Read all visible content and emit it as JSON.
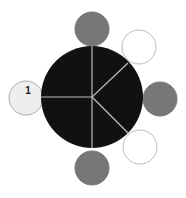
{
  "diagram": {
    "type": "hub-and-satellites",
    "top_cut_text": "",
    "hub": {
      "cx": 92,
      "cy": 97,
      "r": 51,
      "fill": "#111111",
      "divider_color": "#bbbbbb"
    },
    "dividers": [
      {
        "x2": 92,
        "y2": 46
      },
      {
        "x2": 41,
        "y2": 97
      },
      {
        "x2": 92,
        "y2": 148
      },
      {
        "x2": 128,
        "y2": 63
      },
      {
        "x2": 128,
        "y2": 133
      }
    ],
    "satellites": [
      {
        "id": "top",
        "cx": 92,
        "cy": 29,
        "r": 17,
        "fill": "#777777",
        "stroke": "#777777",
        "label": ""
      },
      {
        "id": "upper-right",
        "cx": 139,
        "cy": 47,
        "r": 17,
        "fill": "#ffffff",
        "stroke": "#bbbbbb",
        "label": ""
      },
      {
        "id": "right",
        "cx": 160,
        "cy": 99,
        "r": 17,
        "fill": "#777777",
        "stroke": "#777777",
        "label": ""
      },
      {
        "id": "lower-right",
        "cx": 140,
        "cy": 147,
        "r": 17,
        "fill": "#ffffff",
        "stroke": "#bbbbbb",
        "label": ""
      },
      {
        "id": "bottom",
        "cx": 92,
        "cy": 168,
        "r": 17,
        "fill": "#777777",
        "stroke": "#777777",
        "label": ""
      },
      {
        "id": "left",
        "cx": 26,
        "cy": 98,
        "r": 17,
        "fill": "#eeeeee",
        "stroke": "#aaaaaa",
        "label": "1"
      }
    ]
  }
}
